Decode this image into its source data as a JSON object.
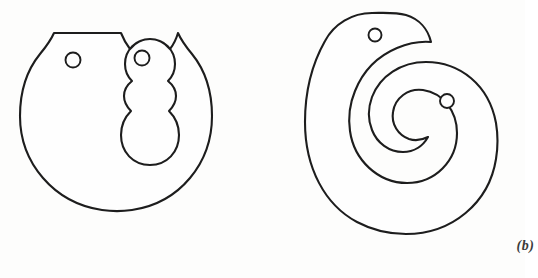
{
  "plate": {
    "name": "two-part-outline-figure-plate",
    "background_color": "#fdfdfc",
    "line_color": "#1d1d1d",
    "fill_color": "#fefefe",
    "width": 525,
    "height": 278
  },
  "figures": [
    {
      "id": "a",
      "caption": "(a)",
      "description": "notched circular disk with central keyhole slot and two small holes",
      "holes": [
        {
          "name": "hole-left",
          "cx": 73,
          "cy": 60,
          "r": 7.5
        },
        {
          "name": "hole-right",
          "cx": 142,
          "cy": 58,
          "r": 7.5
        }
      ],
      "features": [
        "outer-circular-arc",
        "left-notch",
        "right-notch",
        "central-keyhole-slot",
        "wavy-neck"
      ]
    },
    {
      "id": "b",
      "caption": "(b)",
      "description": "comma shaped spiral body with inward hook and two small holes",
      "holes": [
        {
          "name": "hole-upper",
          "cx": 375,
          "cy": 35,
          "r": 6.5
        },
        {
          "name": "hole-lower",
          "cx": 447,
          "cy": 101,
          "r": 7.0
        }
      ],
      "features": [
        "outer-spiral-arc",
        "inner-hook-curl",
        "rounded-lobe-top",
        "rounded-tail-bottom"
      ]
    }
  ]
}
